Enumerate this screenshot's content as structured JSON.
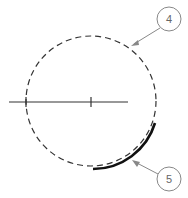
{
  "diagram": {
    "callouts": [
      {
        "label": "4",
        "target": "dashed-circle"
      },
      {
        "label": "5",
        "target": "bold-arc"
      }
    ],
    "colors": {
      "line": "#222222",
      "callout": "#888888",
      "background": "#ffffff"
    }
  }
}
